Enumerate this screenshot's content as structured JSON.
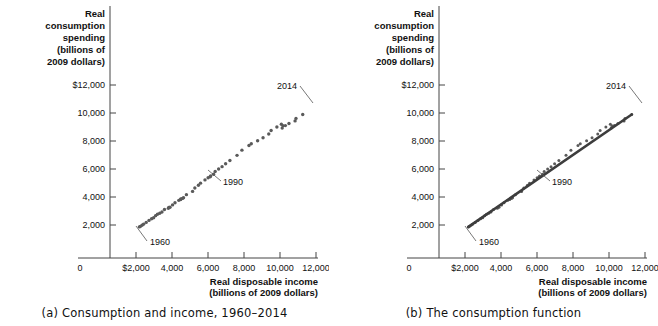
{
  "figure": {
    "panels": [
      {
        "id": "a",
        "caption": "(a) Consumption and income, 1960–2014"
      },
      {
        "id": "b",
        "caption": "(b) The consumption function"
      }
    ]
  },
  "axes": {
    "y_title_lines": [
      "Real",
      "consumption",
      "spending",
      "(billions of",
      "2009 dollars)"
    ],
    "x_title_lines": [
      "Real disposable income",
      "(billions of 2009 dollars)"
    ],
    "y_ticks": [
      "$12,000",
      "10,000",
      "8,000",
      "6,000",
      "4,000",
      "2,000"
    ],
    "x_ticks": [
      "$2,000",
      "4,000",
      "6,000",
      "8,000",
      "10,000",
      "12,000"
    ],
    "origin_label": "0"
  },
  "annotations": {
    "first_year": "1960",
    "mid_year": "1990",
    "last_year": "2014"
  },
  "colors": {
    "dot": "#5a5a5a",
    "line": "#3d3d3d",
    "axis": "#444444",
    "text": "#111111",
    "background": "#ffffff"
  },
  "chart_data": {
    "type": "scatter",
    "title": "Consumption and income, 1960–2014",
    "xlabel": "Real disposable income (billions of 2009 dollars)",
    "ylabel": "Real consumption spending (billions of 2009 dollars)",
    "xlim": [
      0,
      13000
    ],
    "ylim": [
      0,
      12800
    ],
    "xticks": [
      2000,
      4000,
      6000,
      8000,
      10000,
      12000
    ],
    "yticks": [
      2000,
      4000,
      6000,
      8000,
      10000,
      12000
    ],
    "grid": false,
    "legend": null,
    "series": [
      {
        "name": "Consumption vs disposable income",
        "labels": [
          1960,
          1961,
          1962,
          1963,
          1964,
          1965,
          1966,
          1967,
          1968,
          1969,
          1970,
          1971,
          1972,
          1973,
          1974,
          1975,
          1976,
          1977,
          1978,
          1979,
          1980,
          1981,
          1982,
          1983,
          1984,
          1985,
          1986,
          1987,
          1988,
          1989,
          1990,
          1991,
          1992,
          1993,
          1994,
          1995,
          1996,
          1997,
          1998,
          1999,
          2000,
          2001,
          2002,
          2003,
          2004,
          2005,
          2006,
          2007,
          2008,
          2009,
          2010,
          2011,
          2012,
          2013,
          2014
        ],
        "x": [
          2187,
          2240,
          2335,
          2418,
          2566,
          2722,
          2866,
          2981,
          3089,
          3193,
          3318,
          3442,
          3582,
          3825,
          3798,
          3889,
          4031,
          4167,
          4377,
          4487,
          4481,
          4580,
          4641,
          4801,
          5143,
          5269,
          5467,
          5584,
          5833,
          6006,
          6147,
          6121,
          6308,
          6399,
          6591,
          6781,
          6979,
          7216,
          7612,
          7885,
          8276,
          8405,
          8756,
          9059,
          9375,
          9506,
          9827,
          10075,
          10161,
          10122,
          10299,
          10498,
          10838,
          10889,
          11262
        ],
        "y": [
          1865,
          1899,
          1984,
          2060,
          2186,
          2329,
          2450,
          2518,
          2668,
          2768,
          2836,
          2932,
          3103,
          3255,
          3201,
          3263,
          3436,
          3589,
          3759,
          3862,
          3824,
          3899,
          3947,
          4168,
          4399,
          4642,
          4837,
          4991,
          5220,
          5375,
          5502,
          5444,
          5624,
          5819,
          6004,
          6169,
          6377,
          6605,
          6976,
          7348,
          7680,
          7806,
          8013,
          8234,
          8501,
          8754,
          9005,
          9198,
          9098,
          8921,
          9100,
          9248,
          9436,
          9616,
          9895
        ],
        "marker": "circle",
        "color": "#5a5a5a"
      }
    ],
    "panel_b_fit": {
      "name": "Consumption function (fitted line)",
      "type": "line",
      "x": [
        2187,
        11262
      ],
      "y": [
        1865,
        9895
      ],
      "color": "#3d3d3d"
    },
    "annotations": [
      {
        "label": "1960",
        "x": 2187,
        "y": 1865
      },
      {
        "label": "1990",
        "x": 6147,
        "y": 5502
      },
      {
        "label": "2014",
        "x": 11262,
        "y": 9895
      }
    ]
  }
}
